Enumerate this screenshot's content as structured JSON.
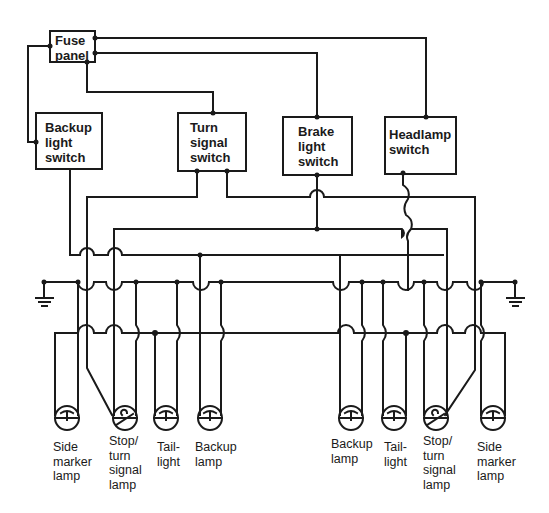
{
  "diagram": {
    "components": {
      "fuse_panel": "Fuse panel",
      "backup_light_switch": "Backup light switch",
      "turn_signal_switch": "Turn signal switch",
      "brake_light_switch": "Brake light switch",
      "headlamp_switch": "Headlamp switch"
    },
    "component_lines": {
      "fuse_panel": [
        "Fuse",
        "panel"
      ],
      "backup_light_switch": [
        "Backup",
        "light",
        "switch"
      ],
      "turn_signal_switch": [
        "Turn",
        "signal",
        "switch"
      ],
      "brake_light_switch": [
        "Brake",
        "light",
        "switch"
      ],
      "headlamp_switch": [
        "Headlamp",
        "switch"
      ]
    },
    "lamps_left": [
      {
        "id": "side-marker-left",
        "lines": [
          "Side",
          "marker",
          "lamp"
        ]
      },
      {
        "id": "stop-turn-left",
        "lines": [
          "Stop/",
          "turn",
          "signal",
          "lamp"
        ]
      },
      {
        "id": "taillight-left",
        "lines": [
          "Tail-",
          "light"
        ]
      },
      {
        "id": "backup-left",
        "lines": [
          "Backup",
          "lamp"
        ]
      }
    ],
    "lamps_right": [
      {
        "id": "backup-right",
        "lines": [
          "Backup",
          "lamp"
        ]
      },
      {
        "id": "taillight-right",
        "lines": [
          "Tail-",
          "light"
        ]
      },
      {
        "id": "stop-turn-right",
        "lines": [
          "Stop/",
          "turn",
          "signal",
          "lamp"
        ]
      },
      {
        "id": "side-marker-right",
        "lines": [
          "Side",
          "marker",
          "lamp"
        ]
      }
    ],
    "grounds": [
      "ground-left",
      "ground-right"
    ],
    "colors": {
      "ink": "#1a1a1a",
      "background": "#ffffff"
    }
  }
}
